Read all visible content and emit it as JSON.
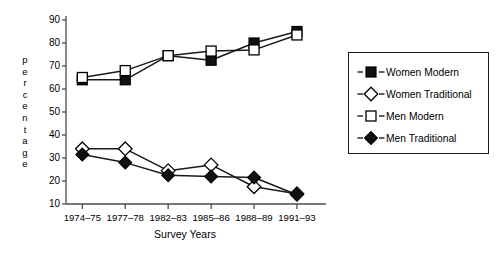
{
  "chart_data": {
    "type": "line",
    "title": "",
    "xlabel": "Survey Years",
    "ylabel": "percentage",
    "categories": [
      "1974–75",
      "1977–78",
      "1982–83",
      "1985–86",
      "1988–89",
      "1991–93"
    ],
    "ylim": [
      10,
      90
    ],
    "yticks": [
      10,
      20,
      30,
      40,
      50,
      60,
      70,
      80,
      90
    ],
    "grid": false,
    "legend_position": "right",
    "series": [
      {
        "name": "Women Modern",
        "marker": "filled-square",
        "values": [
          64,
          64,
          74.5,
          72.5,
          80,
          85
        ]
      },
      {
        "name": "Women Traditional",
        "marker": "open-diamond",
        "values": [
          34,
          34,
          24.5,
          27,
          17.5,
          14.5
        ]
      },
      {
        "name": "Men Modern",
        "marker": "open-square",
        "values": [
          65,
          68,
          74.5,
          76.5,
          77,
          83.5
        ]
      },
      {
        "name": "Men Traditional",
        "marker": "filled-diamond",
        "values": [
          31.5,
          28,
          22.5,
          22,
          21.5,
          14
        ]
      }
    ]
  },
  "axis": {
    "y_title_letters": [
      "p",
      "e",
      "r",
      "c",
      "e",
      "n",
      "t",
      "a",
      "g",
      "e"
    ],
    "x_title": "Survey Years"
  },
  "legend": {
    "items": [
      {
        "label": "Women Modern",
        "marker": "filled-square"
      },
      {
        "label": "Women Traditional",
        "marker": "open-diamond"
      },
      {
        "label": "Men Modern",
        "marker": "open-square"
      },
      {
        "label": "Men Traditional",
        "marker": "filled-diamond"
      }
    ]
  },
  "colors": {
    "line": "#1a1a1a",
    "marker_fill_solid": "#111111",
    "marker_fill_open": "#ffffff",
    "axis": "#4d4d4d",
    "background": "#ffffff"
  }
}
